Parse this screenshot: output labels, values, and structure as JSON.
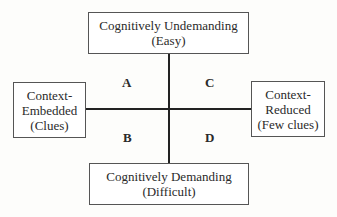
{
  "diagram": {
    "top": {
      "line1": "Cognitively Undemanding",
      "line2": "(Easy)"
    },
    "bottom": {
      "line1": "Cognitively Demanding",
      "line2": "(Difficult)"
    },
    "left": {
      "line1": "Context-",
      "line2": "Embedded",
      "line3": "(Clues)"
    },
    "right": {
      "line1": "Context-",
      "line2": "Reduced",
      "line3": "(Few clues)"
    },
    "quadrants": {
      "top_left": "A",
      "bottom_left": "B",
      "top_right": "C",
      "bottom_right": "D"
    }
  }
}
